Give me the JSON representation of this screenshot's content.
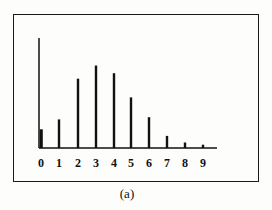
{
  "chart_data": {
    "type": "bar",
    "title": "",
    "caption": "(a)",
    "xlabel": "",
    "ylabel": "",
    "categories": [
      "0",
      "1",
      "2",
      "3",
      "4",
      "5",
      "6",
      "7",
      "8",
      "9"
    ],
    "values": [
      0.17,
      0.26,
      0.63,
      0.75,
      0.68,
      0.46,
      0.28,
      0.11,
      0.05,
      0.03
    ],
    "ylim": [
      0,
      1
    ],
    "grid": false,
    "legend": null
  },
  "colors": {
    "bar": "#111111",
    "axis": "#111111",
    "frame": "#1a1a1a"
  }
}
